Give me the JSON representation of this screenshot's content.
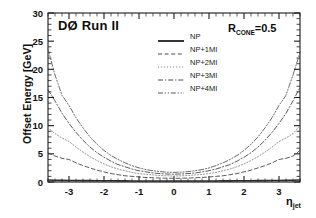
{
  "figure": {
    "experiment_title": "DØ Run II",
    "cone_label_prefix": "R",
    "cone_label_sub": "CONE",
    "cone_label_value": "=0.5",
    "background_color": "#ffffff",
    "frame_color": "#1a1a1a"
  },
  "axes": {
    "ylabel": "Offset Energy [GeV]",
    "xlabel_symbol": "η",
    "xlabel_sub": "jet",
    "x_ticks": [
      "-3",
      "-2",
      "-1",
      "0",
      "1",
      "2",
      "3"
    ],
    "x_tick_values": [
      -3,
      -2,
      -1,
      0,
      1,
      2,
      3
    ],
    "y_ticks": [
      "0",
      "5",
      "10",
      "15",
      "20",
      "25",
      "30"
    ],
    "y_tick_values": [
      0,
      5,
      10,
      15,
      20,
      25,
      30
    ]
  },
  "legend": {
    "position": "upper-center",
    "entries": [
      {
        "label": "NP",
        "style": "solid",
        "color": "#2b2b2b"
      },
      {
        "label": "NP+1MI",
        "style": "dashed",
        "color": "#4a4a4a"
      },
      {
        "label": "NP+2MI",
        "style": "dotted",
        "color": "#8a8a8a"
      },
      {
        "label": "NP+3MI",
        "style": "dashdot",
        "color": "#4a4a4a"
      },
      {
        "label": "NP+4MI",
        "style": "dashdotdot",
        "color": "#5a5a5a"
      }
    ]
  },
  "chart_data": {
    "type": "line",
    "title": "DØ Run II",
    "xlabel": "η_jet",
    "ylabel": "Offset Energy [GeV]",
    "xlim": [
      -3.6,
      3.6
    ],
    "ylim": [
      0,
      30
    ],
    "grid": false,
    "legend_position": "upper-center",
    "annotations": [
      "DØ Run II",
      "R_CONE=0.5"
    ],
    "x": [
      -3.6,
      -3.4,
      -3.2,
      -3.0,
      -2.8,
      -2.6,
      -2.4,
      -2.2,
      -2.0,
      -1.8,
      -1.6,
      -1.4,
      -1.2,
      -1.0,
      -0.8,
      -0.6,
      -0.4,
      -0.2,
      0.0,
      0.2,
      0.4,
      0.6,
      0.8,
      1.0,
      1.2,
      1.4,
      1.6,
      1.8,
      2.0,
      2.2,
      2.4,
      2.6,
      2.8,
      3.0,
      3.2,
      3.4,
      3.6
    ],
    "series": [
      {
        "name": "NP",
        "style": "solid",
        "values": [
          0.35,
          0.3,
          0.28,
          0.27,
          0.26,
          0.25,
          0.24,
          0.23,
          0.22,
          0.21,
          0.2,
          0.2,
          0.19,
          0.19,
          0.19,
          0.18,
          0.18,
          0.18,
          0.18,
          0.18,
          0.18,
          0.18,
          0.19,
          0.19,
          0.19,
          0.2,
          0.2,
          0.21,
          0.22,
          0.23,
          0.24,
          0.25,
          0.26,
          0.27,
          0.28,
          0.3,
          0.35
        ]
      },
      {
        "name": "NP+1MI",
        "style": "dashed",
        "values": [
          5.2,
          4.6,
          4.2,
          4.0,
          3.4,
          2.9,
          2.5,
          2.1,
          1.8,
          1.5,
          1.3,
          1.1,
          1.0,
          0.9,
          0.8,
          0.75,
          0.7,
          0.68,
          0.65,
          0.68,
          0.7,
          0.75,
          0.8,
          0.9,
          1.0,
          1.1,
          1.3,
          1.5,
          1.8,
          2.1,
          2.5,
          2.9,
          3.4,
          4.0,
          4.2,
          4.6,
          5.6
        ]
      },
      {
        "name": "NP+2MI",
        "style": "dotted",
        "values": [
          9.6,
          8.6,
          7.8,
          7.2,
          6.2,
          5.3,
          4.5,
          3.8,
          3.2,
          2.7,
          2.3,
          2.0,
          1.7,
          1.5,
          1.35,
          1.25,
          1.15,
          1.1,
          1.05,
          1.1,
          1.15,
          1.25,
          1.35,
          1.5,
          1.7,
          2.0,
          2.3,
          2.7,
          3.2,
          3.8,
          4.5,
          5.3,
          6.2,
          7.2,
          7.8,
          8.6,
          10.0
        ]
      },
      {
        "name": "NP+3MI",
        "style": "dashdot",
        "values": [
          16.4,
          14.4,
          12.2,
          10.4,
          8.8,
          7.4,
          6.2,
          5.2,
          4.4,
          3.7,
          3.1,
          2.7,
          2.3,
          2.0,
          1.8,
          1.6,
          1.5,
          1.42,
          1.38,
          1.42,
          1.5,
          1.6,
          1.8,
          2.0,
          2.3,
          2.7,
          3.1,
          3.7,
          4.4,
          5.2,
          6.2,
          7.4,
          8.8,
          10.4,
          12.2,
          14.4,
          16.8
        ]
      },
      {
        "name": "NP+4MI",
        "style": "dashdotdot",
        "values": [
          23.6,
          19.0,
          15.4,
          13.6,
          11.4,
          9.6,
          8.0,
          6.7,
          5.6,
          4.7,
          4.0,
          3.4,
          2.9,
          2.5,
          2.2,
          2.0,
          1.85,
          1.75,
          1.7,
          1.75,
          1.85,
          2.0,
          2.2,
          2.5,
          2.9,
          3.4,
          4.0,
          4.7,
          5.6,
          6.7,
          8.0,
          9.6,
          11.4,
          13.6,
          15.4,
          19.0,
          23.0
        ]
      }
    ]
  }
}
